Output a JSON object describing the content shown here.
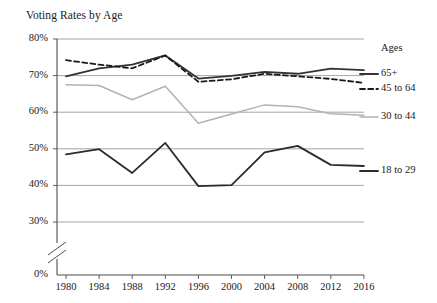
{
  "chart_data": {
    "type": "line",
    "title": "Voting Rates by Age",
    "xlabel": "",
    "ylabel": "",
    "x": [
      1980,
      1984,
      1988,
      1992,
      1996,
      2000,
      2004,
      2008,
      2012,
      2016
    ],
    "xtick_labels": [
      "1980",
      "1984",
      "1988",
      "1992",
      "1996",
      "2000",
      "2004",
      "2008",
      "2012",
      "2016"
    ],
    "ytick_labels": [
      "0%",
      "30%",
      "40%",
      "50%",
      "60%",
      "70%",
      "80%"
    ],
    "ytick_values": [
      0,
      30,
      40,
      50,
      60,
      70,
      80
    ],
    "ylim": [
      30,
      80
    ],
    "axis_break": true,
    "grid": true,
    "legend_position": "right",
    "legend_title": "Ages",
    "series": [
      {
        "name": "65+",
        "style": "solid",
        "color": "#333333",
        "values": [
          69.8,
          72.0,
          73.0,
          75.5,
          69.2,
          69.9,
          71.0,
          70.5,
          71.9,
          71.5
        ]
      },
      {
        "name": "45 to 64",
        "style": "dashed",
        "color": "#1a1a1a",
        "values": [
          74.2,
          73.0,
          72.0,
          75.5,
          68.3,
          69.0,
          70.5,
          69.8,
          69.1,
          68.0
        ]
      },
      {
        "name": "30 to 44",
        "style": "solid",
        "color": "#b3b3b3",
        "values": [
          67.5,
          67.3,
          63.4,
          67.1,
          57.0,
          59.5,
          62.0,
          61.5,
          59.6,
          59.2
        ]
      },
      {
        "name": "18 to 29",
        "style": "solid",
        "color": "#2b2b2b",
        "values": [
          48.5,
          49.9,
          43.4,
          51.6,
          39.8,
          40.1,
          49.0,
          50.8,
          45.6,
          45.3
        ]
      }
    ]
  },
  "legend": {
    "heading": "Ages",
    "items": [
      {
        "label": "65+"
      },
      {
        "label": "45 to 64"
      },
      {
        "label": "30 to 44"
      },
      {
        "label": "18 to 29"
      }
    ]
  }
}
